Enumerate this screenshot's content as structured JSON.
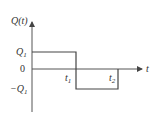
{
  "diagram": {
    "type": "square-pulse-waveform",
    "y_axis_label": "Q(t)",
    "x_axis_label": "t",
    "levels": {
      "positive": {
        "label": "Q",
        "subscript": "1"
      },
      "zero": {
        "label": "0"
      },
      "negative": {
        "label": "−Q",
        "subscript": "1"
      }
    },
    "time_marks": [
      {
        "label": "t",
        "subscript": "1"
      },
      {
        "label": "t",
        "subscript": "2"
      }
    ],
    "colors": {
      "line": "#444444",
      "text": "#333333",
      "background": "#ffffff"
    }
  }
}
